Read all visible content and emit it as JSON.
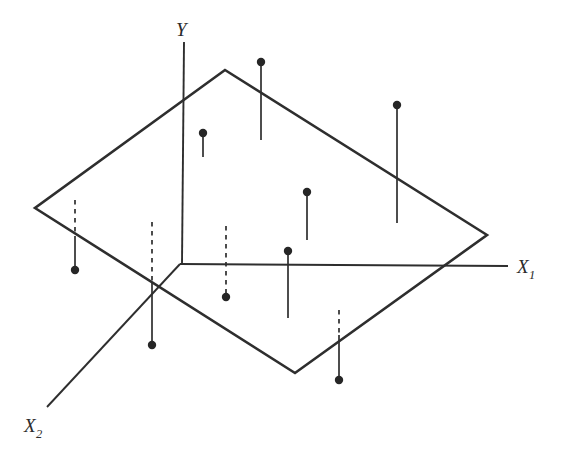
{
  "figure": {
    "title": "",
    "background_color": "#ffffff",
    "line_color": "#2e2e2e",
    "point_color": "#262626",
    "width": 563,
    "height": 459
  },
  "axes": {
    "y": {
      "label": "Y",
      "subscript": "",
      "label_x": 176,
      "label_y": 36,
      "line": {
        "x1": 184,
        "y1": 42,
        "x2": 182,
        "y2": 264
      }
    },
    "x1": {
      "label": "X",
      "subscript": "1",
      "label_x": 517,
      "label_y": 273,
      "line": {
        "x1": 180,
        "y1": 264,
        "x2": 508,
        "y2": 266
      }
    },
    "x2": {
      "label": "X",
      "subscript": "2",
      "label_x": 24,
      "label_y": 432,
      "line": {
        "x1": 180,
        "y1": 264,
        "x2": 47,
        "y2": 407
      }
    }
  },
  "plane": {
    "description": "regression plane drawn as a quadrilateral in perspective",
    "corners": [
      {
        "name": "top",
        "x": 225,
        "y": 70
      },
      {
        "name": "right",
        "x": 487,
        "y": 235
      },
      {
        "name": "bottom",
        "x": 295,
        "y": 373
      },
      {
        "name": "left",
        "x": 35,
        "y": 208
      }
    ]
  },
  "chart_data": {
    "type": "scatter",
    "xlabel": "X₁",
    "ylabel": "Y",
    "zlabel": "X₂",
    "grid": false,
    "legend": null,
    "annotations": [],
    "points_description": "Ten observations shown as filled dots connected by vertical stems to the fitted plane; solid stems lie above the plane, dashed stems lie below it.",
    "points": [
      {
        "id": 1,
        "dot_x": 75,
        "dot_y": 270,
        "plane_y": 200,
        "crossing_y": 238,
        "residual_sign": "negative",
        "stem": [
          {
            "style": "dashed",
            "y1": 200,
            "y2": 238
          },
          {
            "style": "solid",
            "y1": 238,
            "y2": 270
          }
        ]
      },
      {
        "id": 2,
        "dot_x": 152,
        "dot_y": 345,
        "plane_y": 222,
        "crossing_y": 283,
        "residual_sign": "negative",
        "stem": [
          {
            "style": "dashed",
            "y1": 222,
            "y2": 283
          },
          {
            "style": "solid",
            "y1": 283,
            "y2": 345
          }
        ]
      },
      {
        "id": 3,
        "dot_x": 203,
        "dot_y": 133,
        "plane_y": 157,
        "crossing_y": 157,
        "residual_sign": "positive",
        "stem": [
          {
            "style": "solid",
            "y1": 133,
            "y2": 157
          }
        ]
      },
      {
        "id": 4,
        "dot_x": 226,
        "dot_y": 297,
        "plane_y": 226,
        "crossing_y": 297,
        "residual_sign": "negative",
        "stem": [
          {
            "style": "dashed",
            "y1": 226,
            "y2": 297
          }
        ]
      },
      {
        "id": 5,
        "dot_x": 261,
        "dot_y": 62,
        "plane_y": 140,
        "crossing_y": 140,
        "residual_sign": "positive",
        "stem": [
          {
            "style": "solid",
            "y1": 62,
            "y2": 140
          }
        ]
      },
      {
        "id": 6,
        "dot_x": 288,
        "dot_y": 251,
        "plane_y": 318,
        "crossing_y": 318,
        "residual_sign": "positive",
        "stem": [
          {
            "style": "solid",
            "y1": 251,
            "y2": 318
          }
        ]
      },
      {
        "id": 7,
        "dot_x": 307,
        "dot_y": 192,
        "plane_y": 240,
        "crossing_y": 240,
        "residual_sign": "positive",
        "stem": [
          {
            "style": "solid",
            "y1": 192,
            "y2": 240
          }
        ]
      },
      {
        "id": 8,
        "dot_x": 339,
        "dot_y": 380,
        "plane_y": 310,
        "crossing_y": 335,
        "residual_sign": "negative",
        "stem": [
          {
            "style": "dashed",
            "y1": 310,
            "y2": 335
          },
          {
            "style": "solid",
            "y1": 335,
            "y2": 380
          }
        ]
      },
      {
        "id": 9,
        "dot_x": 397,
        "dot_y": 105,
        "plane_y": 223,
        "crossing_y": 223,
        "residual_sign": "positive",
        "stem": [
          {
            "style": "solid",
            "y1": 105,
            "y2": 223
          }
        ]
      }
    ]
  }
}
